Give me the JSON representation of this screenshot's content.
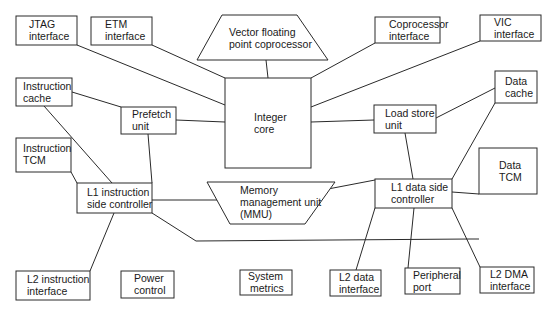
{
  "diagram": {
    "title": "",
    "blocks": {
      "jtag": {
        "line1": "JTAG",
        "line2": "interface"
      },
      "etm": {
        "line1": "ETM",
        "line2": "interface"
      },
      "vfp": {
        "line1": "Vector floating",
        "line2": "point coprocessor"
      },
      "coproc": {
        "line1": "Coprocessor",
        "line2": "interface"
      },
      "vic": {
        "line1": "VIC",
        "line2": "interface"
      },
      "icache": {
        "line1": "Instruction",
        "line2": "cache"
      },
      "prefetch": {
        "line1": "Prefetch",
        "line2": "unit"
      },
      "core": {
        "line1": "Integer",
        "line2": "core"
      },
      "loadstore": {
        "line1": "Load store",
        "line2": "unit"
      },
      "dcache": {
        "line1": "Data",
        "line2": "cache"
      },
      "itcm": {
        "line1": "Instruction",
        "line2": "TCM"
      },
      "dtcm": {
        "line1": "Data",
        "line2": "TCM"
      },
      "l1i": {
        "line1": "L1 instruction",
        "line2": "side controller"
      },
      "mmu": {
        "line1": "Memory",
        "line2": "management unit",
        "line3": "(MMU)"
      },
      "l1d": {
        "line1": "L1 data side",
        "line2": "controller"
      },
      "l2i": {
        "line1": "L2 instruction",
        "line2": "interface"
      },
      "power": {
        "line1": "Power",
        "line2": "control"
      },
      "sysmet": {
        "line1": "System",
        "line2": "metrics"
      },
      "l2d": {
        "line1": "L2 data",
        "line2": "interface"
      },
      "periph": {
        "line1": "Peripheral",
        "line2": "port"
      },
      "l2dma": {
        "line1": "L2 DMA",
        "line2": "interface"
      }
    },
    "colors": {
      "stroke": "#2a2a2a",
      "text": "#1a1a1a",
      "background": "#ffffff"
    }
  }
}
